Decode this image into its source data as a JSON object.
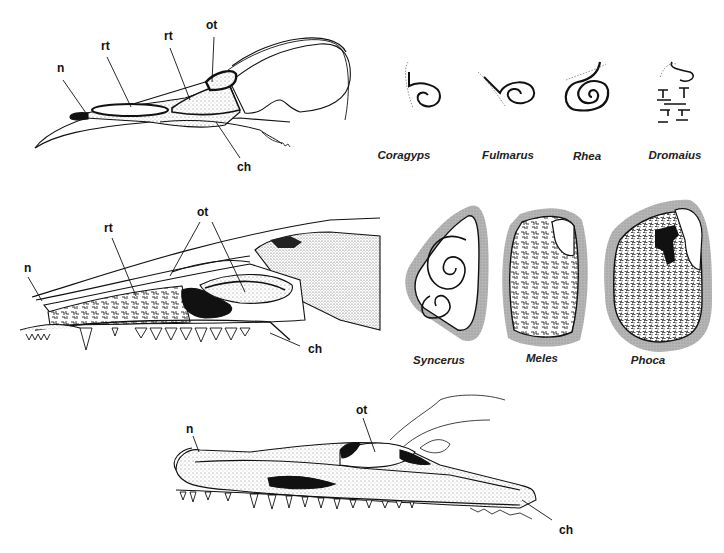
{
  "figure": {
    "panels": {
      "bird_skull": {
        "labels": {
          "n": "n",
          "rt1": "rt",
          "rt2": "rt",
          "ot": "ot",
          "ch": "ch"
        }
      },
      "mammal_skull": {
        "labels": {
          "n": "n",
          "rt": "rt",
          "ot": "ot",
          "ch": "ch"
        }
      },
      "crocodilian_skull": {
        "labels": {
          "n": "n",
          "ot": "ot",
          "ch": "ch"
        }
      },
      "bird_turbinate_sections": [
        {
          "genus": "Coragyps"
        },
        {
          "genus": "Fulmarus"
        },
        {
          "genus": "Rhea"
        },
        {
          "genus": "Dromaius"
        }
      ],
      "mammal_turbinate_sections": [
        {
          "genus": "Syncerus"
        },
        {
          "genus": "Meles"
        },
        {
          "genus": "Phoca"
        }
      ]
    },
    "colors": {
      "ink": "#111111",
      "stipple": "#9a9a9a",
      "section_halo": "#a8a8a8",
      "background": "#ffffff"
    }
  }
}
